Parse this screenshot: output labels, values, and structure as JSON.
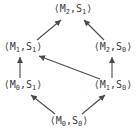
{
  "diagram": {
    "type": "hasse-lattice",
    "background_color": "#ffffff",
    "text_color": "#3b3b3b",
    "arrow_color": "#4a4a4a",
    "nodes": [
      {
        "id": "m2s1",
        "label": "⟨M2,S1⟩",
        "pre": "⟨M",
        "m_sub": "2",
        "mid": ",S",
        "s_sub": "1",
        "post": "⟩",
        "position": "top"
      },
      {
        "id": "m1s1",
        "label": "⟨M1,S1⟩",
        "pre": "⟨M",
        "m_sub": "1",
        "mid": ",S",
        "s_sub": "1",
        "post": "⟩",
        "position": "middle-left"
      },
      {
        "id": "m2s0",
        "label": "⟨M2,S0⟩",
        "pre": "⟨M",
        "m_sub": "2",
        "mid": ",S",
        "s_sub": "0",
        "post": "⟩",
        "position": "middle-right"
      },
      {
        "id": "m0s1",
        "label": "⟨M0,S1⟩",
        "pre": "⟨M",
        "m_sub": "0",
        "mid": ",S",
        "s_sub": "1",
        "post": "⟩",
        "position": "lower-left"
      },
      {
        "id": "m1s0",
        "label": "⟨M1,S0⟩",
        "pre": "⟨M",
        "m_sub": "1",
        "mid": ",S",
        "s_sub": "0",
        "post": "⟩",
        "position": "lower-right"
      },
      {
        "id": "m0s0",
        "label": "⟨M0,S0⟩",
        "pre": "⟨M",
        "m_sub": "0",
        "mid": ",S",
        "s_sub": "0",
        "post": "⟩",
        "position": "bottom"
      }
    ],
    "edges": [
      {
        "from": "⟨M1,S1⟩",
        "to": "⟨M2,S1⟩"
      },
      {
        "from": "⟨M2,S0⟩",
        "to": "⟨M2,S1⟩"
      },
      {
        "from": "⟨M0,S1⟩",
        "to": "⟨M1,S1⟩"
      },
      {
        "from": "⟨M1,S0⟩",
        "to": "⟨M1,S1⟩"
      },
      {
        "from": "⟨M1,S0⟩",
        "to": "⟨M2,S0⟩"
      },
      {
        "from": "⟨M0,S0⟩",
        "to": "⟨M0,S1⟩"
      },
      {
        "from": "⟨M0,S0⟩",
        "to": "⟨M1,S0⟩"
      }
    ]
  }
}
